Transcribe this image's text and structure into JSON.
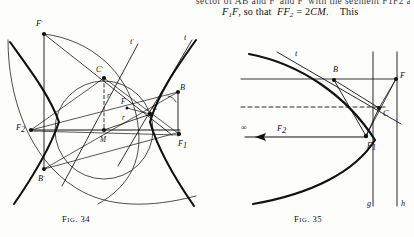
{
  "page": {
    "background_color": "#fdfdfc",
    "ink_color": "#111111"
  },
  "text": {
    "cut_line_top": "sector of AB and F' and F' with the segment F1F2 and",
    "line": {
      "part1": "F",
      "part1_sub": "1",
      "part2": "F",
      "part3": ", so that",
      "part4": "FF",
      "part4_sub": "2",
      "part5": "= 2",
      "part6": "CM",
      "part7": ".",
      "part8": "This"
    },
    "line_plain": "F1F, so that FF2 = 2CM.   This"
  },
  "figures": [
    {
      "id": "fig-34",
      "caption_prefix": "F",
      "caption_small": "IG",
      "caption_number": ". 34",
      "caption_full": "FIG. 34",
      "type": "hyperbola-construction",
      "labels": [
        {
          "name": "F-prime",
          "text": "F",
          "prime": "'",
          "x": 38,
          "y": 8
        },
        {
          "name": "t-prime",
          "text": "t",
          "prime": "'",
          "x": 131,
          "y": 23
        },
        {
          "name": "t",
          "text": "t",
          "prime": "",
          "x": 186,
          "y": 20
        },
        {
          "name": "C-prime",
          "text": "C",
          "prime": "'",
          "x": 104,
          "y": 54
        },
        {
          "name": "B",
          "text": "B",
          "prime": "",
          "x": 172,
          "y": 70
        },
        {
          "name": "r-prime",
          "text": "r",
          "prime": "'",
          "x": 107,
          "y": 77
        },
        {
          "name": "F",
          "text": "F",
          "prime": "",
          "x": 124,
          "y": 85
        },
        {
          "name": "C",
          "text": "C",
          "prime": "",
          "x": 149,
          "y": 90
        },
        {
          "name": "F-two",
          "text": "F",
          "sub": "2",
          "x": 18,
          "y": 100
        },
        {
          "name": "r",
          "text": "r",
          "prime": "",
          "x": 122,
          "y": 98
        },
        {
          "name": "M",
          "text": "M",
          "prime": "",
          "x": 100,
          "y": 113
        },
        {
          "name": "F-one",
          "text": "F",
          "sub": "1",
          "x": 163,
          "y": 113
        },
        {
          "name": "B-prime",
          "text": "B",
          "prime": "'",
          "x": 42,
          "y": 152
        }
      ]
    },
    {
      "id": "fig-35",
      "caption_prefix": "F",
      "caption_small": "IG",
      "caption_number": ". 35",
      "caption_full": "FIG. 35",
      "type": "parabola-construction",
      "labels": [
        {
          "name": "t",
          "text": "t",
          "prime": "",
          "x": 78,
          "y": 30
        },
        {
          "name": "B",
          "text": "B",
          "prime": "",
          "x": 120,
          "y": 48
        },
        {
          "name": "F",
          "text": "F",
          "prime": "",
          "x": 180,
          "y": 57
        },
        {
          "name": "C",
          "text": "C",
          "prime": "",
          "x": 170,
          "y": 81
        },
        {
          "name": "F-one",
          "text": "F",
          "sub": "1",
          "x": 152,
          "y": 110
        },
        {
          "name": "infinity-arrow-F2",
          "text": "∞ ←— F",
          "sub": "2",
          "x": 52,
          "y": 102
        },
        {
          "name": "g",
          "text": "g",
          "prime": "",
          "x": 158,
          "y": 176
        },
        {
          "name": "h",
          "text": "h",
          "prime": "",
          "x": 182,
          "y": 176
        }
      ]
    }
  ]
}
